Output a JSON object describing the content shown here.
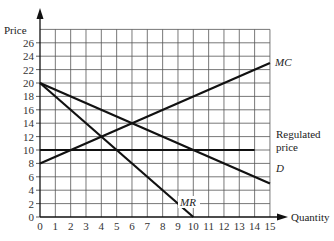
{
  "chart_data": {
    "type": "line",
    "title": "",
    "xlabel": "Quantity",
    "ylabel": "Price",
    "xlim": [
      0,
      15
    ],
    "ylim": [
      0,
      28
    ],
    "grid": true,
    "x_ticks": [
      0,
      1,
      2,
      3,
      4,
      5,
      6,
      7,
      8,
      9,
      10,
      11,
      12,
      13,
      14,
      15
    ],
    "y_ticks": [
      0,
      2,
      4,
      6,
      8,
      10,
      12,
      14,
      16,
      18,
      20,
      22,
      24,
      26
    ],
    "series": [
      {
        "name": "MC",
        "label": "MC",
        "points": [
          [
            0,
            8
          ],
          [
            15,
            23
          ]
        ]
      },
      {
        "name": "D",
        "label": "D",
        "points": [
          [
            0,
            20
          ],
          [
            15,
            5
          ]
        ]
      },
      {
        "name": "MR",
        "label": "MR",
        "points": [
          [
            0,
            20
          ],
          [
            10,
            0
          ]
        ]
      },
      {
        "name": "Regulated price",
        "label": "Regulated price",
        "points": [
          [
            0,
            10
          ],
          [
            14,
            10
          ]
        ]
      }
    ],
    "annotations": [
      {
        "text": "MC",
        "x": 15.3,
        "y": 23
      },
      {
        "text": "D",
        "x": 15.3,
        "y": 5
      },
      {
        "text": "MR",
        "x": 8.7,
        "y": 2
      },
      {
        "text": "Regulated price",
        "x": 15.3,
        "y": 10
      }
    ]
  },
  "labels": {
    "y_axis": "Price",
    "x_axis": "Quantity",
    "mc": "MC",
    "d": "D",
    "mr": "MR",
    "regulated_line1": "Regulated",
    "regulated_line2": "price"
  }
}
